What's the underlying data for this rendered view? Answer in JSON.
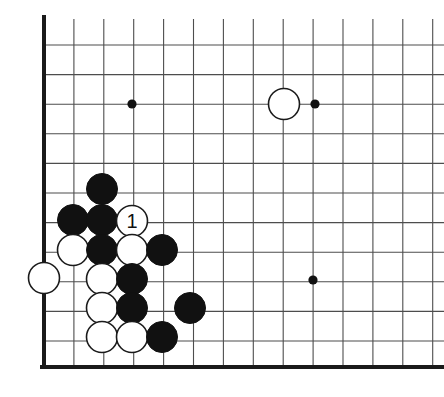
{
  "figure": {
    "kind": "go-board-diagram",
    "background_color": "#ffffff",
    "line_color": "#4d4d4d",
    "edge_color": "#1a1a1a",
    "black_stone_color": "#111111",
    "white_stone_color": "#ffffff",
    "white_stone_outline": "#1a1a1a",
    "star_point_color": "#111111"
  },
  "board": {
    "origin_x": 44,
    "origin_y": 45,
    "spacing_x": 29.9,
    "spacing_y": 29.6,
    "cols": 14,
    "rows": 11,
    "left_edge_x": 44,
    "bottom_edge_y": 367,
    "edge_line_width": 4,
    "grid_line_width": 1.1,
    "stone_radius": 15.5,
    "star_point_radius": 4.6
  },
  "star_points": [
    {
      "name": "hoshi-upper-left",
      "cx": 132,
      "cy": 104
    },
    {
      "name": "hoshi-upper-right",
      "cx": 315,
      "cy": 104
    },
    {
      "name": "hoshi-lower-right",
      "cx": 313,
      "cy": 280
    }
  ],
  "stones": [
    {
      "id": "w-upper-right-approach",
      "color": "white",
      "cx": 284,
      "cy": 104,
      "label": ""
    },
    {
      "id": "b-c1",
      "color": "black",
      "cx": 102,
      "cy": 189,
      "label": ""
    },
    {
      "id": "b-c2",
      "color": "black",
      "cx": 73,
      "cy": 220,
      "label": ""
    },
    {
      "id": "b-c3",
      "color": "black",
      "cx": 102,
      "cy": 220,
      "label": ""
    },
    {
      "id": "w-move-1",
      "color": "white",
      "cx": 132,
      "cy": 221,
      "label": "1"
    },
    {
      "id": "w-c4",
      "color": "white",
      "cx": 73,
      "cy": 250,
      "label": ""
    },
    {
      "id": "b-c5",
      "color": "black",
      "cx": 102,
      "cy": 250,
      "label": ""
    },
    {
      "id": "w-c6",
      "color": "white",
      "cx": 132,
      "cy": 250,
      "label": ""
    },
    {
      "id": "b-c7",
      "color": "black",
      "cx": 162,
      "cy": 250,
      "label": ""
    },
    {
      "id": "w-edge",
      "color": "white",
      "cx": 44,
      "cy": 278,
      "label": ""
    },
    {
      "id": "w-c8",
      "color": "white",
      "cx": 102,
      "cy": 279,
      "label": ""
    },
    {
      "id": "b-c9",
      "color": "black",
      "cx": 132,
      "cy": 279,
      "label": ""
    },
    {
      "id": "w-c10",
      "color": "white",
      "cx": 102,
      "cy": 308,
      "label": ""
    },
    {
      "id": "b-c11",
      "color": "black",
      "cx": 132,
      "cy": 308,
      "label": ""
    },
    {
      "id": "b-c12",
      "color": "black",
      "cx": 190,
      "cy": 308,
      "label": ""
    },
    {
      "id": "w-c13",
      "color": "white",
      "cx": 102,
      "cy": 337,
      "label": ""
    },
    {
      "id": "w-c14",
      "color": "white",
      "cx": 132,
      "cy": 337,
      "label": ""
    },
    {
      "id": "b-c15",
      "color": "black",
      "cx": 162,
      "cy": 337,
      "label": ""
    }
  ],
  "move_label": {
    "text": "1",
    "font_size": 20,
    "color": "#111111"
  }
}
